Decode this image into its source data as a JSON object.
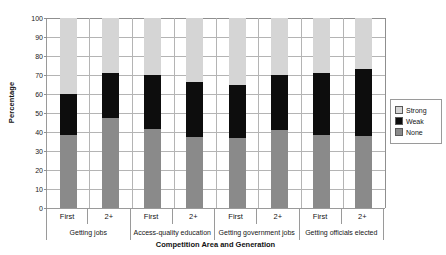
{
  "chart_data": {
    "type": "bar",
    "subtype": "stacked-bar-100",
    "title": "",
    "xlabel": "Competition Area and Generation",
    "ylabel": "Percentage",
    "ylim": [
      0,
      100
    ],
    "ytick_values": [
      0,
      10,
      20,
      30,
      40,
      50,
      60,
      70,
      80,
      90,
      100
    ],
    "ytick_labels": [
      "0",
      "10",
      "20",
      "30",
      "40",
      "50",
      "60",
      "70",
      "80",
      "90",
      "100"
    ],
    "grid": true,
    "legend_position": "right",
    "categories": [
      "First",
      "2+",
      "First",
      "2+",
      "First",
      "2+",
      "First",
      "2+"
    ],
    "groups": [
      {
        "label": "Getting jobs",
        "span": 2
      },
      {
        "label": "Access-quality education",
        "span": 2
      },
      {
        "label": "Getting government jobs",
        "span": 2
      },
      {
        "label": "Getting officials elected",
        "span": 2
      }
    ],
    "series": [
      {
        "name": "None",
        "color": "#8a8a8a",
        "values": [
          38.5,
          47.5,
          41.5,
          37.5,
          37.0,
          41.0,
          38.5,
          38.0
        ]
      },
      {
        "name": "Weak",
        "color": "#0d0d0d",
        "values": [
          21.5,
          23.5,
          28.5,
          29.0,
          27.5,
          29.0,
          32.5,
          35.0
        ]
      },
      {
        "name": "Strong",
        "color": "#d5d5d5",
        "values": [
          40.0,
          29.0,
          30.0,
          33.5,
          35.5,
          30.0,
          29.0,
          27.0
        ]
      }
    ],
    "cumulative_tops": {
      "none": [
        38.5,
        47.5,
        41.5,
        37.5,
        37.0,
        41.0,
        38.5,
        38.0
      ],
      "weak": [
        60.0,
        71.0,
        70.0,
        66.5,
        64.5,
        70.0,
        71.0,
        73.0
      ],
      "strong": [
        100,
        100,
        100,
        100,
        100,
        100,
        100,
        100
      ]
    }
  },
  "legend": {
    "items": [
      {
        "label": "Strong",
        "swatch": "light-gray-swatch"
      },
      {
        "label": "Weak",
        "swatch": "black-swatch"
      },
      {
        "label": "None",
        "swatch": "medium-gray-swatch"
      }
    ]
  }
}
